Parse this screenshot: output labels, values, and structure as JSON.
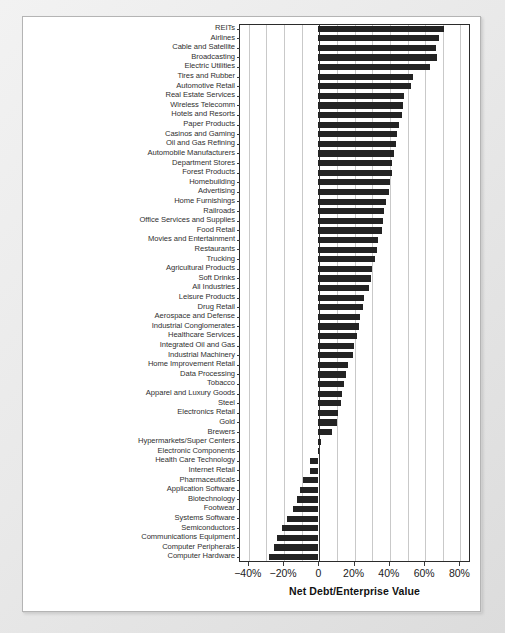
{
  "chart_data": {
    "type": "bar",
    "orientation": "horizontal",
    "title": "",
    "xlabel": "Net Debt/Enterprise Value",
    "ylabel": "",
    "xlim": [
      -45,
      86
    ],
    "xticks": [
      -40,
      -20,
      0,
      20,
      40,
      60,
      80
    ],
    "xticklabels": [
      "−40%",
      "−20%",
      "0",
      "20%",
      "40%",
      "60%",
      "80%"
    ],
    "gridlines": [
      -40,
      -30,
      -20,
      -10,
      0,
      10,
      20,
      30,
      40,
      50,
      60,
      70,
      80
    ],
    "grid": true,
    "legend": null,
    "bar_color": "#232323",
    "categories": [
      "REITs",
      "Airlines",
      "Cable and Satellite",
      "Broadcasting",
      "Electric Utilities",
      "Tires and Rubber",
      "Automotive Retail",
      "Real Estate Services",
      "Wireless Telecomm",
      "Hotels and Resorts",
      "Paper Products",
      "Casinos and Gaming",
      "Oil and Gas Refining",
      "Automobile Manufacturers",
      "Department Stores",
      "Forest Products",
      "Homebuilding",
      "Advertising",
      "Home Furnishings",
      "Railroads",
      "Office Services and Supplies",
      "Food Retail",
      "Movies and Entertainment",
      "Restaurants",
      "Trucking",
      "Agricultural Products",
      "Soft Drinks",
      "All Industries",
      "Leisure Products",
      "Drug Retail",
      "Aerospace and Defense",
      "Industrial Conglomerates",
      "Healthcare Services",
      "Integrated Oil and Gas",
      "Industrial Machinery",
      "Home Improvement Retail",
      "Data Processing",
      "Tobacco",
      "Apparel and Luxury Goods",
      "Steel",
      "Electronics Retail",
      "Gold",
      "Brewers",
      "Hypermarkets/Super Centers",
      "Electronic Components",
      "Health Care Technology",
      "Internet Retail",
      "Pharmaceuticals",
      "Application Software",
      "Biotechnology",
      "Footwear",
      "Systems Software",
      "Semiconductors",
      "Communications Equipment",
      "Computer Peripherals",
      "Computer Hardware"
    ],
    "values": [
      71.0,
      68.5,
      67.0,
      67.5,
      63.5,
      53.5,
      52.5,
      48.5,
      48.0,
      47.5,
      46.0,
      44.5,
      44.0,
      43.0,
      42.0,
      41.5,
      40.5,
      40.0,
      38.5,
      37.0,
      36.5,
      36.0,
      34.0,
      33.0,
      32.0,
      30.5,
      30.0,
      28.5,
      26.0,
      25.5,
      23.5,
      23.0,
      22.0,
      20.0,
      19.5,
      17.0,
      15.5,
      14.5,
      13.5,
      13.0,
      11.0,
      10.5,
      8.0,
      1.5,
      0.5,
      -4.5,
      -5.0,
      -8.5,
      -10.5,
      -12.0,
      -14.5,
      -17.5,
      -20.5,
      -23.5,
      -25.0,
      -28.0
    ]
  }
}
